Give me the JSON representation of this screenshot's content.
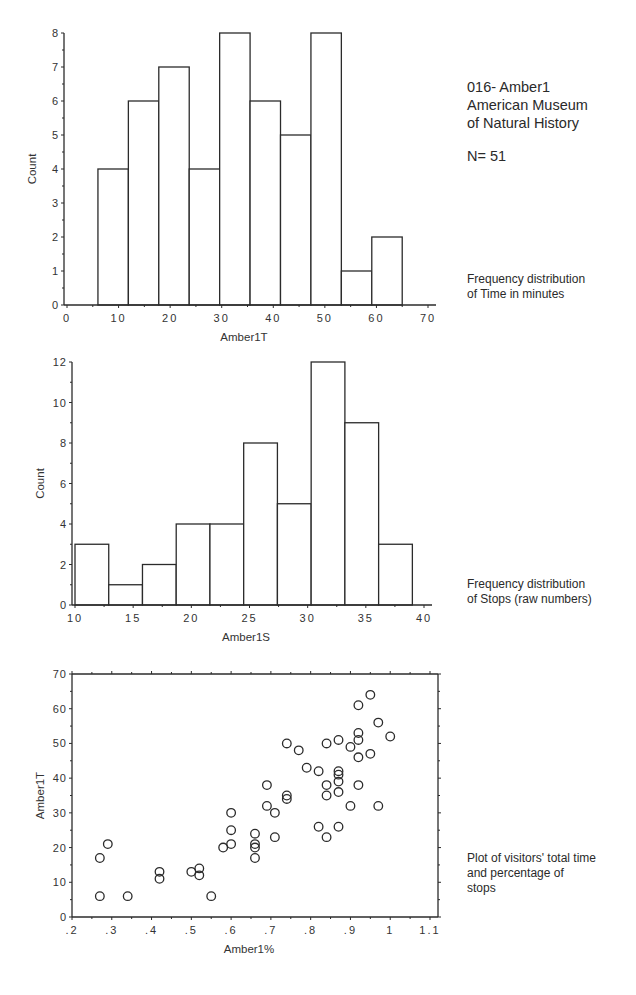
{
  "side": {
    "title_lines": [
      "016- Amber1",
      "American Museum",
      "of Natural History"
    ],
    "n_label": "N= 51",
    "captions": [
      [
        "Frequency distribution",
        "of Time in minutes"
      ],
      [
        "Frequency distribution",
        "of Stops (raw numbers)"
      ],
      [
        "Plot of visitors' total time",
        "and percentage of",
        "stops"
      ]
    ]
  },
  "chart_data": [
    {
      "type": "bar",
      "subtype": "histogram",
      "title": "",
      "xlabel": "Amber1T",
      "ylabel": "Count",
      "bin_edges": [
        6,
        11.9,
        17.8,
        23.7,
        29.6,
        35.5,
        41.4,
        47.3,
        53.2,
        59.1,
        65
      ],
      "values": [
        4,
        6,
        7,
        4,
        8,
        6,
        5,
        8,
        1,
        2
      ],
      "xlim": [
        0,
        70
      ],
      "ylim": [
        0,
        8
      ],
      "xticks": [
        0,
        10,
        20,
        30,
        40,
        50,
        60,
        70
      ],
      "yticks": [
        0,
        1,
        2,
        3,
        4,
        5,
        6,
        7,
        8
      ],
      "grid": false
    },
    {
      "type": "bar",
      "subtype": "histogram",
      "title": "",
      "xlabel": "Amber1S",
      "ylabel": "Count",
      "bin_edges": [
        10,
        12.9,
        15.8,
        18.7,
        21.6,
        24.5,
        27.4,
        30.3,
        33.2,
        36.1,
        39
      ],
      "values": [
        3,
        1,
        2,
        4,
        4,
        8,
        5,
        12,
        9,
        3
      ],
      "xlim": [
        10,
        40
      ],
      "ylim": [
        0,
        12
      ],
      "xticks": [
        10,
        15,
        20,
        25,
        30,
        35,
        40
      ],
      "yticks": [
        0,
        2,
        4,
        6,
        8,
        10,
        12
      ],
      "grid": false
    },
    {
      "type": "scatter",
      "title": "",
      "xlabel": "Amber1%",
      "ylabel": "Amber1T",
      "xlim": [
        0.2,
        1.1
      ],
      "ylim": [
        0,
        70
      ],
      "xticks": [
        ".2",
        ".3",
        ".4",
        ".5",
        ".6",
        ".7",
        ".8",
        ".9",
        "1",
        "1.1"
      ],
      "xtick_values": [
        0.2,
        0.3,
        0.4,
        0.5,
        0.6,
        0.7,
        0.8,
        0.9,
        1.0,
        1.1
      ],
      "yticks": [
        0,
        10,
        20,
        30,
        40,
        50,
        60,
        70
      ],
      "grid": false,
      "marker": "open-circle",
      "points": [
        [
          0.27,
          17
        ],
        [
          0.27,
          6
        ],
        [
          0.29,
          21
        ],
        [
          0.34,
          6
        ],
        [
          0.42,
          13
        ],
        [
          0.42,
          11
        ],
        [
          0.5,
          13
        ],
        [
          0.52,
          14
        ],
        [
          0.52,
          12
        ],
        [
          0.55,
          6
        ],
        [
          0.58,
          20
        ],
        [
          0.6,
          30
        ],
        [
          0.6,
          25
        ],
        [
          0.6,
          21
        ],
        [
          0.66,
          24
        ],
        [
          0.66,
          21
        ],
        [
          0.66,
          20
        ],
        [
          0.66,
          17
        ],
        [
          0.69,
          38
        ],
        [
          0.69,
          32
        ],
        [
          0.71,
          30
        ],
        [
          0.71,
          23
        ],
        [
          0.74,
          50
        ],
        [
          0.74,
          35
        ],
        [
          0.74,
          34
        ],
        [
          0.77,
          48
        ],
        [
          0.79,
          43
        ],
        [
          0.82,
          42
        ],
        [
          0.82,
          26
        ],
        [
          0.84,
          50
        ],
        [
          0.84,
          38
        ],
        [
          0.84,
          35
        ],
        [
          0.84,
          23
        ],
        [
          0.87,
          51
        ],
        [
          0.87,
          42
        ],
        [
          0.87,
          41
        ],
        [
          0.87,
          39
        ],
        [
          0.87,
          36
        ],
        [
          0.87,
          26
        ],
        [
          0.9,
          49
        ],
        [
          0.9,
          32
        ],
        [
          0.92,
          61
        ],
        [
          0.92,
          53
        ],
        [
          0.92,
          51
        ],
        [
          0.92,
          46
        ],
        [
          0.92,
          38
        ],
        [
          0.95,
          64
        ],
        [
          0.95,
          47
        ],
        [
          0.97,
          56
        ],
        [
          0.97,
          32
        ],
        [
          1.0,
          52
        ]
      ]
    }
  ]
}
